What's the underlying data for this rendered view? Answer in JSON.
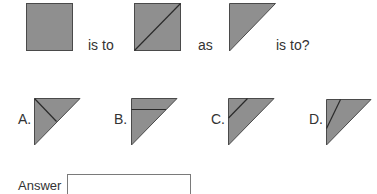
{
  "colors": {
    "shape_fill": "#8f8f8f",
    "shape_stroke": "#4a4a4a",
    "text": "#333333",
    "answer_border": "#7a7a7a"
  },
  "question": {
    "shape1": {
      "type": "square",
      "icon": "filled-square-icon"
    },
    "word1": "is to",
    "shape2": {
      "type": "square-with-diagonal",
      "icon": "square-diagonal-icon"
    },
    "word2": "as",
    "shape3": {
      "type": "right-triangle",
      "icon": "right-triangle-icon"
    },
    "word3": "is to?"
  },
  "options": [
    {
      "label": "A.",
      "description": "right triangle with line from corner to hypotenuse midpoint"
    },
    {
      "label": "B.",
      "description": "right triangle with horizontal line near top"
    },
    {
      "label": "C.",
      "description": "right triangle with line parallel to hypotenuse near corner"
    },
    {
      "label": "D.",
      "description": "right triangle with steep line from top edge to left edge"
    }
  ],
  "answer": {
    "label": "Answer",
    "value": "",
    "placeholder": ""
  }
}
